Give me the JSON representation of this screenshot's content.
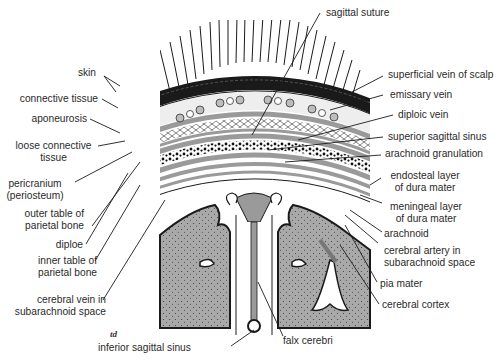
{
  "figure": {
    "signature": "td"
  },
  "labels_left": [
    {
      "id": "skin",
      "text": "skin"
    },
    {
      "id": "connective-tissue",
      "text": "connective tissue"
    },
    {
      "id": "aponeurosis",
      "text": "aponeurosis"
    },
    {
      "id": "loose-connective-tissue",
      "line1": "loose connective",
      "line2": "tissue"
    },
    {
      "id": "pericranium",
      "line1": "pericranium",
      "line2": "(periosteum)"
    },
    {
      "id": "outer-table",
      "line1": "outer table of",
      "line2": "parietal bone"
    },
    {
      "id": "diploe",
      "text": "diploe"
    },
    {
      "id": "inner-table",
      "line1": "inner table of",
      "line2": "parietal bone"
    },
    {
      "id": "cerebral-vein",
      "line1": "cerebral vein in",
      "line2": "subarachnoid space"
    }
  ],
  "labels_right": [
    {
      "id": "superficial-vein",
      "text": "superficial vein of scalp"
    },
    {
      "id": "emissary-vein",
      "text": "emissary vein"
    },
    {
      "id": "diploic-vein",
      "text": "diploic vein"
    },
    {
      "id": "superior-sagittal-sinus",
      "text": "superior sagittal sinus"
    },
    {
      "id": "arachnoid-granulation",
      "text": "arachnoid granulation"
    },
    {
      "id": "endosteal-layer",
      "line1": "endosteal layer",
      "line2": "of dura mater"
    },
    {
      "id": "meningeal-layer",
      "line1": "meningeal layer",
      "line2": "of dura mater"
    },
    {
      "id": "arachnoid",
      "text": "arachnoid"
    },
    {
      "id": "cerebral-artery",
      "line1": "cerebral artery in",
      "line2": "subarachnoid space"
    },
    {
      "id": "pia-mater",
      "text": "pia mater"
    },
    {
      "id": "cerebral-cortex",
      "text": "cerebral cortex"
    }
  ],
  "labels_top": [
    {
      "id": "sagittal-suture",
      "text": "sagittal suture"
    }
  ],
  "labels_bottom": [
    {
      "id": "inferior-sagittal-sinus",
      "text": "inferior sagittal sinus"
    },
    {
      "id": "falx-cerebri",
      "text": "falx cerebri"
    }
  ],
  "colors": {
    "line": "#1a1a1a",
    "grey_fill": "#a9a9a9",
    "bone_grey": "#9a9a9a",
    "light_grey": "#d9d9d9",
    "text": "#2a2a2a",
    "background": "#ffffff"
  }
}
